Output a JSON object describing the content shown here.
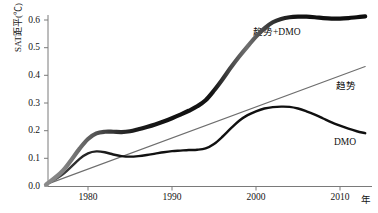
{
  "chart_data": {
    "type": "line",
    "title": "",
    "xlabel": "年",
    "ylabel": "SAT距平(℃)",
    "xlim": [
      1975,
      1013
    ],
    "x_axis_range": [
      1975,
      2014
    ],
    "ylim": [
      0.0,
      0.65
    ],
    "grid": false,
    "legend_position": "inline-annotations",
    "xticks": [
      "1980",
      "1990",
      "2000",
      "2010"
    ],
    "xtick_values": [
      1980,
      1990,
      2000,
      2010
    ],
    "yticks": [
      "0.0",
      "0.1",
      "0.2",
      "0.3",
      "0.4",
      "0.5",
      "0.6"
    ],
    "ytick_values": [
      0.0,
      0.1,
      0.2,
      0.3,
      0.4,
      0.5,
      0.6
    ],
    "series": [
      {
        "name": "趋势+DMO",
        "label": "趋势+DMO",
        "color": "#111111",
        "style": "thick-line",
        "x": [
          1975,
          1977,
          1979,
          1980,
          1981,
          1982,
          1983,
          1984,
          1985,
          1986,
          1987,
          1988,
          1989,
          1990,
          1991,
          1992,
          1993,
          1994,
          1995,
          1996,
          1997,
          1998,
          1999,
          2000,
          2001,
          2002,
          2003,
          2004,
          2005,
          2006,
          2007,
          2008,
          2009,
          2010,
          2011,
          2012,
          2013
        ],
        "values": [
          0.005,
          0.055,
          0.135,
          0.17,
          0.19,
          0.196,
          0.196,
          0.195,
          0.198,
          0.205,
          0.213,
          0.222,
          0.233,
          0.245,
          0.258,
          0.272,
          0.288,
          0.31,
          0.345,
          0.385,
          0.428,
          0.468,
          0.505,
          0.54,
          0.57,
          0.592,
          0.604,
          0.61,
          0.612,
          0.612,
          0.61,
          0.607,
          0.605,
          0.605,
          0.607,
          0.61,
          0.613
        ]
      },
      {
        "name": "趋势",
        "label": "趋势",
        "color": "#6e6e6e",
        "style": "thin-line",
        "x": [
          1975,
          2013
        ],
        "values": [
          0.005,
          0.432
        ]
      },
      {
        "name": "DMO",
        "label": "DMO",
        "color": "#111111",
        "style": "medium-line",
        "x": [
          1975,
          1977,
          1979,
          1980,
          1981,
          1982,
          1983,
          1984,
          1985,
          1986,
          1987,
          1988,
          1989,
          1990,
          1991,
          1992,
          1993,
          1994,
          1995,
          1996,
          1997,
          1998,
          1999,
          2000,
          2001,
          2002,
          2003,
          2004,
          2005,
          2006,
          2007,
          2008,
          2009,
          2010,
          2011,
          2012,
          2013
        ],
        "values": [
          0.005,
          0.042,
          0.098,
          0.118,
          0.125,
          0.122,
          0.114,
          0.108,
          0.106,
          0.108,
          0.112,
          0.117,
          0.122,
          0.126,
          0.128,
          0.13,
          0.131,
          0.136,
          0.152,
          0.178,
          0.208,
          0.236,
          0.256,
          0.27,
          0.28,
          0.285,
          0.287,
          0.286,
          0.28,
          0.27,
          0.258,
          0.244,
          0.23,
          0.218,
          0.207,
          0.198,
          0.191
        ]
      }
    ],
    "annotations": [
      {
        "text": "趋势+DMO",
        "x_px": 253,
        "y_px": 31
      },
      {
        "text": "趋势",
        "x_px": 336,
        "y_px": 85
      },
      {
        "text": "DMO",
        "x_px": 334,
        "y_px": 144
      }
    ]
  },
  "axis": {
    "y_title": "SAT距平(℃)",
    "x_unit": "年"
  }
}
